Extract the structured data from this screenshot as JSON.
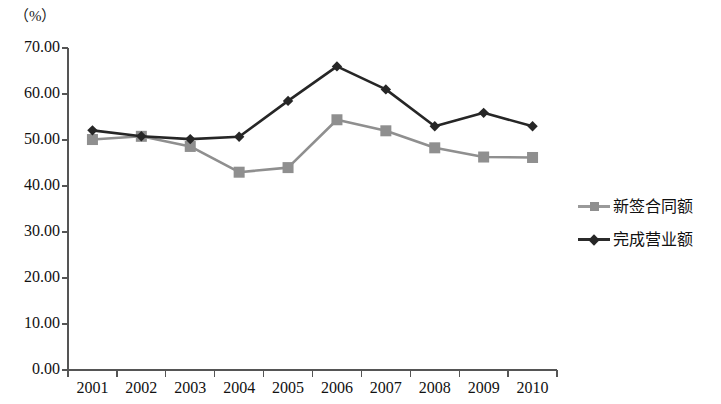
{
  "chart_data": {
    "type": "line",
    "title": "",
    "subtitle": "",
    "unit_label": "（%）",
    "xlabel": "",
    "ylabel": "",
    "ylim": [
      0,
      70
    ],
    "ytick_step": 10,
    "grid": false,
    "legend_position": "right",
    "categories": [
      "2001",
      "2002",
      "2003",
      "2004",
      "2005",
      "2006",
      "2007",
      "2008",
      "2009",
      "2010"
    ],
    "ytick_labels": [
      "70.00",
      "60.00",
      "50.00",
      "40.00",
      "30.00",
      "20.00",
      "10.00",
      "0.00"
    ],
    "ytick_values": [
      70,
      60,
      50,
      40,
      30,
      20,
      10,
      0
    ],
    "series": [
      {
        "name": "新签合同额",
        "color": "#8f8f8f",
        "marker": "square",
        "values": [
          50.1,
          50.8,
          48.6,
          43.0,
          44.0,
          54.4,
          52.0,
          48.3,
          46.3,
          46.2
        ]
      },
      {
        "name": "完成营业额",
        "color": "#262626",
        "marker": "diamond",
        "values": [
          52.1,
          50.8,
          50.2,
          50.7,
          58.5,
          66.0,
          61.0,
          53.0,
          55.9,
          53.0
        ]
      }
    ]
  },
  "legend": {
    "items": [
      {
        "label": "新签合同额"
      },
      {
        "label": "完成营业额"
      }
    ]
  }
}
